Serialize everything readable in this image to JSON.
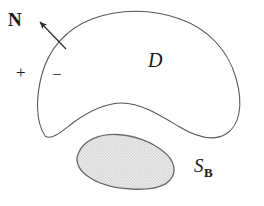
{
  "figure": {
    "background_color": "#ffffff",
    "stroke_color": "#555555",
    "text_color": "#1a1a1a",
    "blob_fill_color": "#e2e2e2",
    "blob_stroke_color": "#6a6a6a",
    "labels": {
      "normal_vector": "N",
      "domain": "D",
      "plus_sign": "+",
      "minus_sign": "−",
      "surface_symbol": "S",
      "surface_subscript": "B"
    },
    "icons": {
      "normal_arrow": "arrow-up-left-icon",
      "outer_boundary": "closed-curve-icon",
      "inner_blob": "shaded-blob-icon"
    },
    "geometry": {
      "canvas_width": 264,
      "canvas_height": 206,
      "outer_curve_path": "M 45.5 136.5 C 35 122 36 96 42 74 C 49 49 66 29 92 19 C 120 8.5 152 9 180 19 C 208 29 228 50 236 78 C 244 106 239 126 226 134 C 213 142 196 137 178 126 C 158 114 140 103 122 103 C 104 103 88 112 74 122 C 62 131 53 140 45.5 136.5 Z",
      "inner_blob_path": "M 79 152 C 84 141 98 134 116 134.5 C 134 135 152 142 164 152 C 175 161 177 172 170 180 C 163 188 148 190 131 189 C 112 188 96 183 86 175 C 77 168 75 159 79 152 Z",
      "arrow_tail": [
        66,
        49
      ],
      "arrow_head": [
        37,
        19
      ]
    }
  }
}
